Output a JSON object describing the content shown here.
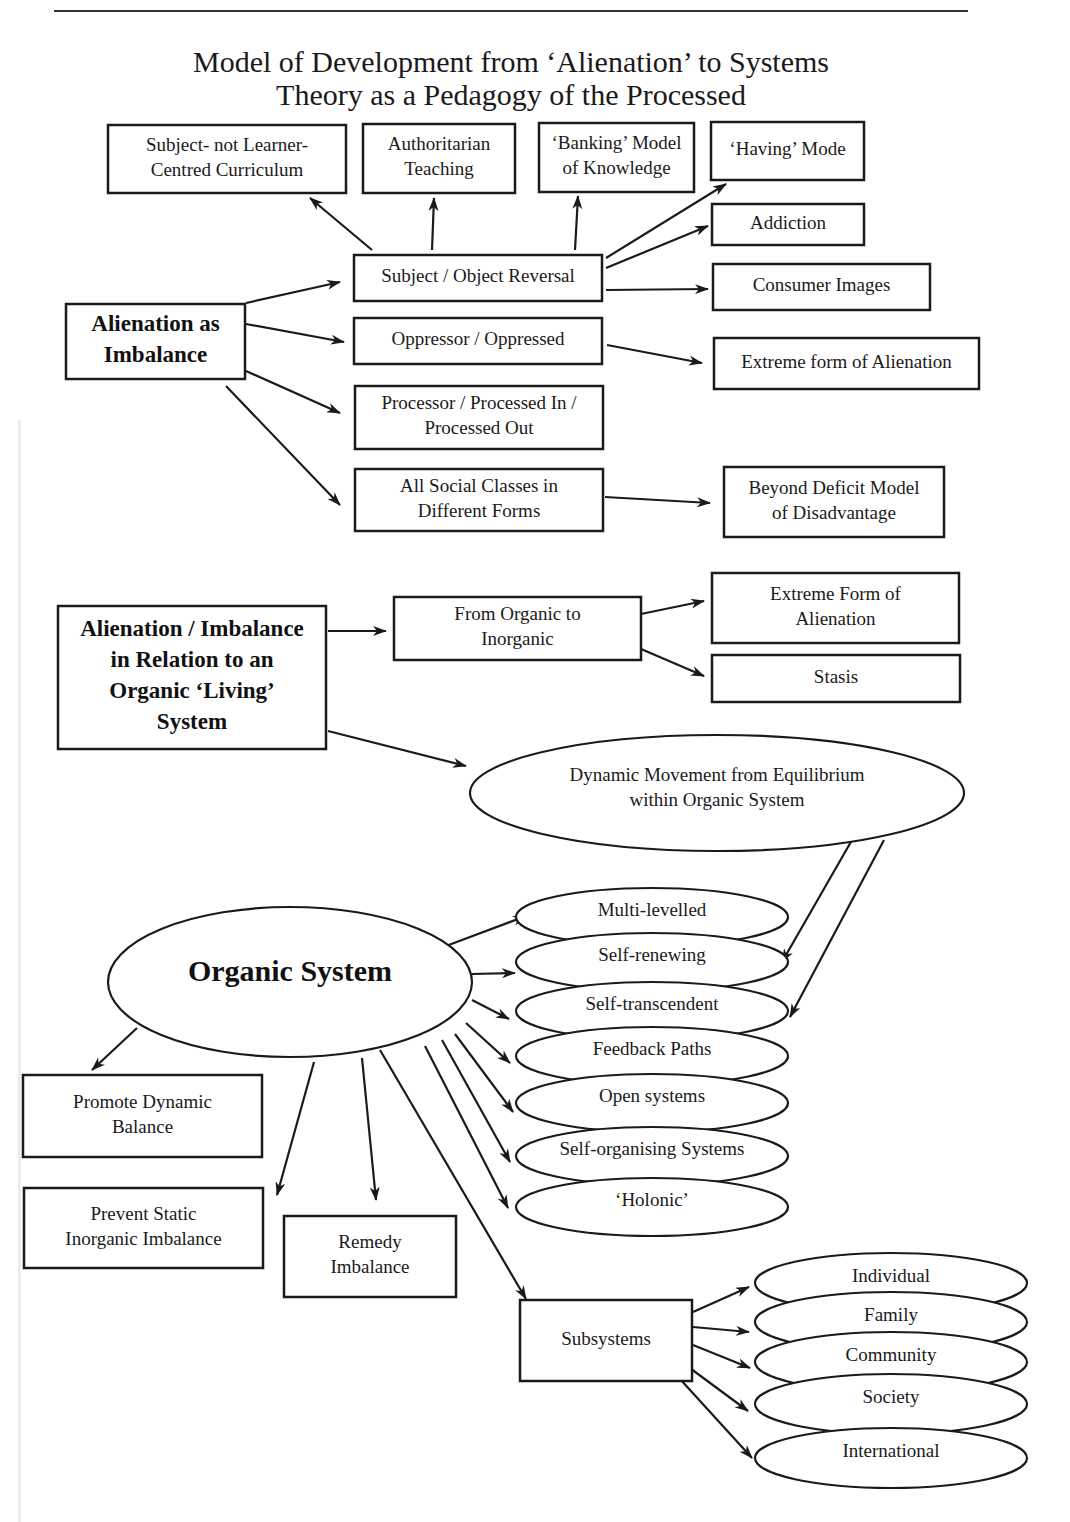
{
  "title": {
    "line1": "Model of Development from ‘Alienation’ to Systems",
    "line2": "Theory as a Pedagogy of the Processed"
  },
  "nodes": {
    "subject_not_learner": {
      "lines": [
        "Subject- not Learner-",
        "Centred Curriculum"
      ],
      "shape": "rect",
      "x": 108,
      "y": 125,
      "w": 238,
      "h": 68
    },
    "authoritarian": {
      "lines": [
        "Authoritarian",
        "Teaching"
      ],
      "shape": "rect",
      "x": 363,
      "y": 124,
      "w": 152,
      "h": 69
    },
    "banking": {
      "lines": [
        "‘Banking’ Model",
        "of Knowledge"
      ],
      "shape": "rect",
      "x": 539,
      "y": 123,
      "w": 155,
      "h": 69
    },
    "having": {
      "lines": [
        "‘Having’ Mode"
      ],
      "shape": "rect",
      "x": 711,
      "y": 122,
      "w": 153,
      "h": 58
    },
    "addiction": {
      "lines": [
        "Addiction"
      ],
      "shape": "rect",
      "x": 712,
      "y": 204,
      "w": 152,
      "h": 41
    },
    "consumer": {
      "lines": [
        "Consumer Images"
      ],
      "shape": "rect",
      "x": 713,
      "y": 264,
      "w": 217,
      "h": 46
    },
    "extreme1": {
      "lines": [
        "Extreme form of Alienation"
      ],
      "shape": "rect",
      "x": 714,
      "y": 338,
      "w": 265,
      "h": 51
    },
    "beyond": {
      "lines": [
        "Beyond Deficit Model",
        "of Disadvantage"
      ],
      "shape": "rect",
      "x": 724,
      "y": 467,
      "w": 220,
      "h": 70
    },
    "alienation_imbalance": {
      "lines": [
        "Alienation as",
        "Imbalance"
      ],
      "shape": "rect",
      "bold": true,
      "x": 66,
      "y": 304,
      "w": 179,
      "h": 75
    },
    "subj_obj": {
      "lines": [
        "Subject / Object Reversal"
      ],
      "shape": "rect",
      "x": 354,
      "y": 255,
      "w": 248,
      "h": 46
    },
    "oppressor": {
      "lines": [
        "Oppressor / Oppressed"
      ],
      "shape": "rect",
      "x": 354,
      "y": 318,
      "w": 248,
      "h": 46
    },
    "processor": {
      "lines": [
        "Processor / Processed In /",
        "Processed Out"
      ],
      "shape": "rect",
      "x": 355,
      "y": 386,
      "w": 248,
      "h": 63
    },
    "social": {
      "lines": [
        "All Social Classes in",
        "Different Forms"
      ],
      "shape": "rect",
      "x": 355,
      "y": 469,
      "w": 248,
      "h": 62
    },
    "alienation_organic": {
      "lines": [
        "Alienation / Imbalance",
        "in Relation to an",
        "Organic ‘Living’",
        "System"
      ],
      "shape": "rect",
      "bold": true,
      "x": 58,
      "y": 606,
      "w": 268,
      "h": 143
    },
    "organic_to_inorganic": {
      "lines": [
        "From Organic to",
        "Inorganic"
      ],
      "shape": "rect",
      "x": 394,
      "y": 597,
      "w": 247,
      "h": 63
    },
    "extreme2": {
      "lines": [
        "Extreme Form of",
        "Alienation"
      ],
      "shape": "rect",
      "x": 712,
      "y": 573,
      "w": 247,
      "h": 70
    },
    "stasis": {
      "lines": [
        "Stasis"
      ],
      "shape": "rect",
      "x": 712,
      "y": 655,
      "w": 248,
      "h": 47
    },
    "dynamic": {
      "lines": [
        "Dynamic Movement from Equilibrium",
        "within Organic System"
      ],
      "shape": "ellipse",
      "cx": 717,
      "cy": 793,
      "rx": 247,
      "ry": 58
    },
    "organic_system": {
      "lines": [
        "Organic System"
      ],
      "shape": "ellipse",
      "xl": true,
      "cx": 290,
      "cy": 982,
      "rx": 182,
      "ry": 75
    },
    "promote": {
      "lines": [
        "Promote Dynamic",
        "Balance"
      ],
      "shape": "rect",
      "x": 23,
      "y": 1075,
      "w": 239,
      "h": 82
    },
    "prevent": {
      "lines": [
        "Prevent Static",
        "Inorganic Imbalance"
      ],
      "shape": "rect",
      "x": 24,
      "y": 1188,
      "w": 239,
      "h": 80
    },
    "remedy": {
      "lines": [
        "Remedy",
        "Imbalance"
      ],
      "shape": "rect",
      "x": 284,
      "y": 1216,
      "w": 172,
      "h": 81
    },
    "subsystems": {
      "lines": [
        "Subsystems"
      ],
      "shape": "rect",
      "x": 520,
      "y": 1300,
      "w": 172,
      "h": 81
    }
  },
  "properties_stack": {
    "cx": 652,
    "rx": 136,
    "ry": 29,
    "items": [
      {
        "label": "Multi-levelled",
        "cy": 917
      },
      {
        "label": "Self-renewing",
        "cy": 962
      },
      {
        "label": "Self-transcendent",
        "cy": 1011
      },
      {
        "label": "Feedback Paths",
        "cy": 1056
      },
      {
        "label": "Open systems",
        "cy": 1103
      },
      {
        "label": "Self-organising Systems",
        "cy": 1156
      },
      {
        "label": "‘Holonic’",
        "cy": 1207
      }
    ]
  },
  "subsystem_stack": {
    "cx": 891,
    "rx": 136,
    "ry": 30,
    "items": [
      {
        "label": "Individual",
        "cy": 1283
      },
      {
        "label": "Family",
        "cy": 1322
      },
      {
        "label": "Community",
        "cy": 1362
      },
      {
        "label": "Society",
        "cy": 1404
      },
      {
        "label": "International",
        "cy": 1458
      }
    ]
  },
  "edges": [
    [
      372,
      250,
      310,
      198
    ],
    [
      432,
      250,
      434,
      198
    ],
    [
      575,
      250,
      578,
      196
    ],
    [
      606,
      258,
      726,
      184
    ],
    [
      606,
      268,
      708,
      226
    ],
    [
      606,
      290,
      708,
      289
    ],
    [
      607,
      345,
      702,
      363
    ],
    [
      605,
      497,
      710,
      503
    ],
    [
      246,
      303,
      340,
      282
    ],
    [
      246,
      324,
      344,
      342
    ],
    [
      246,
      371,
      340,
      413
    ],
    [
      226,
      386,
      340,
      505
    ],
    [
      328,
      631,
      386,
      631
    ],
    [
      641,
      614,
      704,
      601
    ],
    [
      641,
      649,
      704,
      676
    ],
    [
      328,
      731,
      466,
      766
    ],
    [
      852,
      840,
      782,
      962
    ],
    [
      884,
      840,
      790,
      1017
    ],
    [
      446,
      946,
      526,
      916
    ],
    [
      472,
      974,
      515,
      973
    ],
    [
      472,
      1000,
      509,
      1019
    ],
    [
      466,
      1023,
      510,
      1063
    ],
    [
      455,
      1034,
      513,
      1112
    ],
    [
      442,
      1040,
      510,
      1162
    ],
    [
      425,
      1046,
      508,
      1208
    ],
    [
      380,
      1050,
      526,
      1299
    ],
    [
      137,
      1028,
      92,
      1070
    ],
    [
      314,
      1062,
      277,
      1195
    ],
    [
      362,
      1058,
      376,
      1200
    ],
    [
      693,
      1312,
      749,
      1287
    ],
    [
      693,
      1327,
      749,
      1332
    ],
    [
      693,
      1345,
      750,
      1368
    ],
    [
      679,
      1360,
      748,
      1411
    ],
    [
      680,
      1379,
      752,
      1458
    ]
  ]
}
